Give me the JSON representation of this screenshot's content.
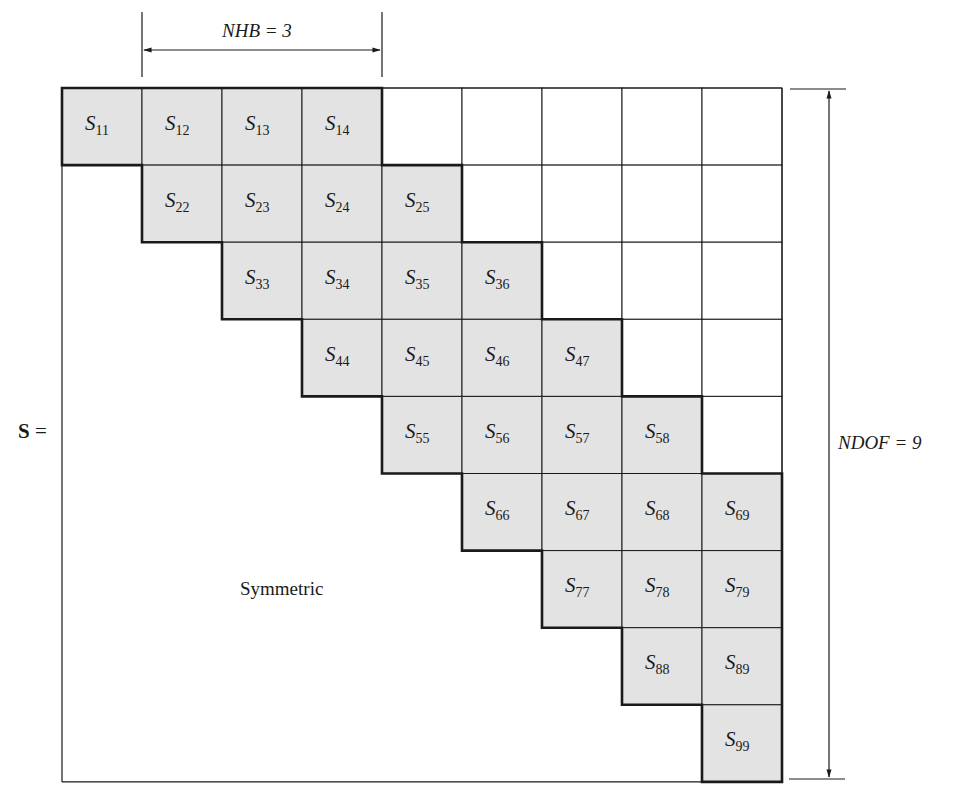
{
  "diagram": {
    "matrix_symbol": "S",
    "equals": "=",
    "nhb_label": "NHB = 3",
    "ndof_label": "NDOF = 9",
    "symmetric_label": "Symmetric",
    "nhb": 3,
    "ndof": 9,
    "colors": {
      "band_fill": "#e3e3e3",
      "line": "#1a1a1a",
      "background": "#ffffff"
    },
    "band_cells": [
      {
        "row": 1,
        "col": 1,
        "label": "S",
        "sub": "11"
      },
      {
        "row": 1,
        "col": 2,
        "label": "S",
        "sub": "12"
      },
      {
        "row": 1,
        "col": 3,
        "label": "S",
        "sub": "13"
      },
      {
        "row": 1,
        "col": 4,
        "label": "S",
        "sub": "14"
      },
      {
        "row": 2,
        "col": 2,
        "label": "S",
        "sub": "22"
      },
      {
        "row": 2,
        "col": 3,
        "label": "S",
        "sub": "23"
      },
      {
        "row": 2,
        "col": 4,
        "label": "S",
        "sub": "24"
      },
      {
        "row": 2,
        "col": 5,
        "label": "S",
        "sub": "25"
      },
      {
        "row": 3,
        "col": 3,
        "label": "S",
        "sub": "33"
      },
      {
        "row": 3,
        "col": 4,
        "label": "S",
        "sub": "34"
      },
      {
        "row": 3,
        "col": 5,
        "label": "S",
        "sub": "35"
      },
      {
        "row": 3,
        "col": 6,
        "label": "S",
        "sub": "36"
      },
      {
        "row": 4,
        "col": 4,
        "label": "S",
        "sub": "44"
      },
      {
        "row": 4,
        "col": 5,
        "label": "S",
        "sub": "45"
      },
      {
        "row": 4,
        "col": 6,
        "label": "S",
        "sub": "46"
      },
      {
        "row": 4,
        "col": 7,
        "label": "S",
        "sub": "47"
      },
      {
        "row": 5,
        "col": 5,
        "label": "S",
        "sub": "55"
      },
      {
        "row": 5,
        "col": 6,
        "label": "S",
        "sub": "56"
      },
      {
        "row": 5,
        "col": 7,
        "label": "S",
        "sub": "57"
      },
      {
        "row": 5,
        "col": 8,
        "label": "S",
        "sub": "58"
      },
      {
        "row": 6,
        "col": 6,
        "label": "S",
        "sub": "66"
      },
      {
        "row": 6,
        "col": 7,
        "label": "S",
        "sub": "67"
      },
      {
        "row": 6,
        "col": 8,
        "label": "S",
        "sub": "68"
      },
      {
        "row": 6,
        "col": 9,
        "label": "S",
        "sub": "69"
      },
      {
        "row": 7,
        "col": 7,
        "label": "S",
        "sub": "77"
      },
      {
        "row": 7,
        "col": 8,
        "label": "S",
        "sub": "78"
      },
      {
        "row": 7,
        "col": 9,
        "label": "S",
        "sub": "79"
      },
      {
        "row": 8,
        "col": 8,
        "label": "S",
        "sub": "88"
      },
      {
        "row": 8,
        "col": 9,
        "label": "S",
        "sub": "89"
      },
      {
        "row": 9,
        "col": 9,
        "label": "S",
        "sub": "99"
      }
    ]
  }
}
